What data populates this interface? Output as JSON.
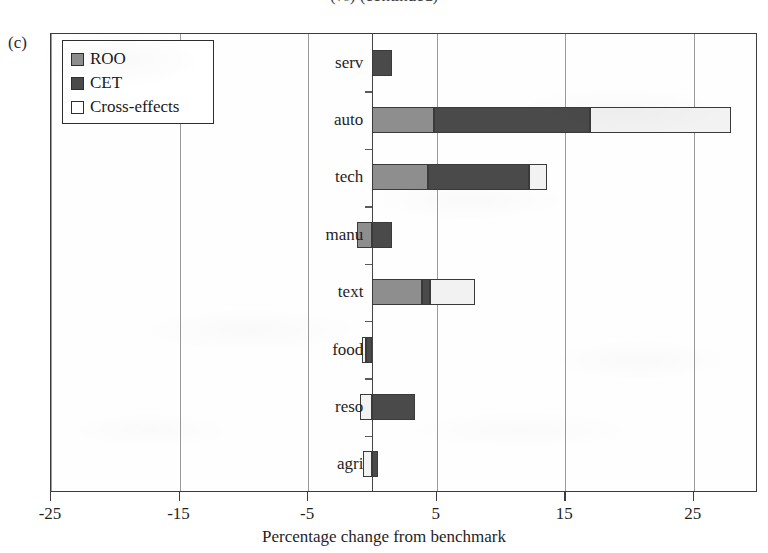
{
  "figure": {
    "panel_letter": "(c)",
    "clipped_title": "(%) (continued)"
  },
  "legend": {
    "items": [
      {
        "label": "ROO",
        "color": "#8e8e8e",
        "key": "roo"
      },
      {
        "label": "CET",
        "color": "#4a4a4a",
        "key": "cet"
      },
      {
        "label": "Cross-effects",
        "color": "#ffffff",
        "key": "cross"
      }
    ]
  },
  "axis": {
    "x_title": "Percentage change from benchmark",
    "x_ticks": [
      "-25",
      "-15",
      "-5",
      "5",
      "15",
      "25"
    ]
  },
  "chart_data": {
    "type": "bar",
    "orientation": "horizontal",
    "stacked": true,
    "title": "",
    "xlabel": "Percentage change from benchmark",
    "ylabel": "",
    "xlim": [
      -25,
      30
    ],
    "xticks": [
      -25,
      -15,
      -5,
      5,
      15,
      25
    ],
    "grid": true,
    "legend_position": "upper-left-inside",
    "categories": [
      "serv",
      "auto",
      "tech",
      "manu",
      "text",
      "food",
      "reso",
      "agri"
    ],
    "series": [
      {
        "name": "ROO",
        "color": "#8e8e8e",
        "values": [
          0.0,
          4.8,
          4.3,
          -1.2,
          3.9,
          0.0,
          0.0,
          0.0
        ]
      },
      {
        "name": "CET",
        "color": "#4a4a4a",
        "values": [
          1.5,
          12.1,
          7.9,
          1.5,
          0.6,
          -0.5,
          3.3,
          0.4
        ]
      },
      {
        "name": "Cross-effects",
        "color": "#ffffff",
        "values": [
          0.0,
          11.0,
          1.4,
          0.0,
          3.5,
          -0.3,
          -1.0,
          -0.7
        ]
      }
    ],
    "totals": [
      1.5,
      27.9,
      13.6,
      0.3,
      8.0,
      -0.8,
      2.3,
      -0.3
    ],
    "segments": [
      {
        "category": "serv",
        "parts": [
          {
            "series": "CET",
            "from": 0.0,
            "to": 1.5
          }
        ]
      },
      {
        "category": "auto",
        "parts": [
          {
            "series": "ROO",
            "from": 0.0,
            "to": 4.8
          },
          {
            "series": "CET",
            "from": 4.8,
            "to": 16.9
          },
          {
            "series": "Cross-effects",
            "from": 16.9,
            "to": 27.9
          }
        ]
      },
      {
        "category": "tech",
        "parts": [
          {
            "series": "ROO",
            "from": 0.0,
            "to": 4.3
          },
          {
            "series": "CET",
            "from": 4.3,
            "to": 12.2
          },
          {
            "series": "Cross-effects",
            "from": 12.2,
            "to": 13.6
          }
        ]
      },
      {
        "category": "manu",
        "parts": [
          {
            "series": "ROO",
            "from": -1.2,
            "to": 0.0
          },
          {
            "series": "CET",
            "from": 0.0,
            "to": 1.5
          }
        ]
      },
      {
        "category": "text",
        "parts": [
          {
            "series": "ROO",
            "from": 0.0,
            "to": 3.9
          },
          {
            "series": "CET",
            "from": 3.9,
            "to": 4.5
          },
          {
            "series": "Cross-effects",
            "from": 4.5,
            "to": 8.0
          }
        ]
      },
      {
        "category": "food",
        "parts": [
          {
            "series": "Cross-effects",
            "from": -0.8,
            "to": -0.5
          },
          {
            "series": "CET",
            "from": -0.5,
            "to": 0.0
          }
        ]
      },
      {
        "category": "reso",
        "parts": [
          {
            "series": "Cross-effects",
            "from": -1.0,
            "to": 0.0
          },
          {
            "series": "CET",
            "from": 0.0,
            "to": 3.3
          }
        ]
      },
      {
        "category": "agri",
        "parts": [
          {
            "series": "Cross-effects",
            "from": -0.7,
            "to": 0.0
          },
          {
            "series": "CET",
            "from": 0.0,
            "to": 0.4
          }
        ]
      }
    ]
  }
}
